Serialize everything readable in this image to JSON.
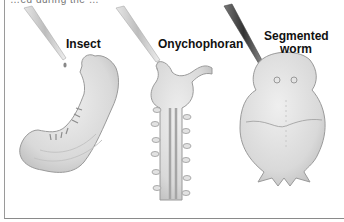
{
  "figure": {
    "caption_fragment": "…ed during the …",
    "panels": [
      {
        "label": "Insect",
        "organism": "insect-embryo"
      },
      {
        "label": "Onychophoran",
        "organism": "onychophoran-embryo"
      },
      {
        "label_line1": "Segmented",
        "label_line2": "worm",
        "organism": "segmented-worm-larva"
      }
    ],
    "colors": {
      "embryo_fill": "#dcdcdc",
      "embryo_stroke": "#9a9a9a",
      "pipette_light": "#cfcfcf",
      "pipette_dark": "#555555",
      "label_text": "#111111"
    }
  }
}
